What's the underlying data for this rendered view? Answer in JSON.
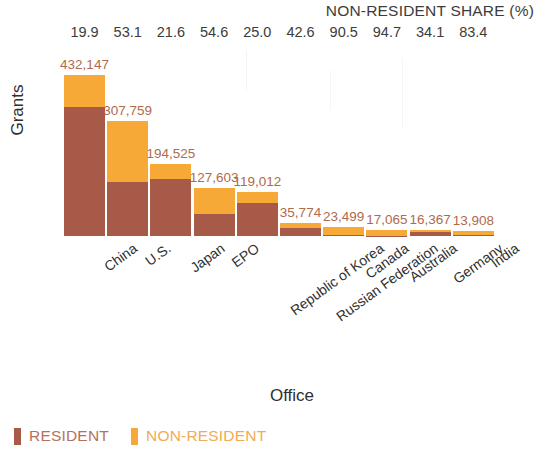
{
  "chart_data": {
    "type": "bar",
    "stacked": true,
    "title": "",
    "xlabel": "Office",
    "ylabel": "Grants",
    "grid": false,
    "legend_position": "bottom-left",
    "categories": [
      "China",
      "U.S.",
      "Japan",
      "EPO",
      "Republic of Korea",
      "Russian Federation",
      "Canada",
      "Australia",
      "Germany",
      "India"
    ],
    "totals": [
      "432,147",
      "307,759",
      "194,525",
      "127,603",
      "119,012",
      "35,774",
      "23,499",
      "17,065",
      "16,367",
      "13,908"
    ],
    "totals_numeric": [
      432147,
      307759,
      194525,
      127603,
      119012,
      35774,
      23499,
      17065,
      16367,
      13908
    ],
    "nonresident_share_header": "NON-RESIDENT SHARE (%)",
    "nonresident_share": [
      "19.9",
      "53.1",
      "21.6",
      "54.6",
      "25.0",
      "42.6",
      "90.5",
      "94.7",
      "34.1",
      "83.4"
    ],
    "nonresident_share_numeric": [
      19.9,
      53.1,
      21.6,
      54.6,
      25.0,
      42.6,
      90.5,
      94.7,
      34.1,
      83.4
    ],
    "series": [
      {
        "name": "RESIDENT",
        "color": "#a75a48",
        "values": [
          346150,
          144339,
          152548,
          57932,
          89259,
          20534,
          2232,
          904,
          10786,
          2309
        ]
      },
      {
        "name": "NON-RESIDENT",
        "color": "#f7a938",
        "values": [
          85997,
          163420,
          41977,
          69671,
          29753,
          15240,
          21267,
          16161,
          5581,
          11599
        ]
      }
    ],
    "ylim": [
      0,
      432147
    ]
  },
  "legend": {
    "items": [
      {
        "label": "RESIDENT",
        "color": "#a75a48"
      },
      {
        "label": "NON-RESIDENT",
        "color": "#f7a938"
      }
    ]
  }
}
